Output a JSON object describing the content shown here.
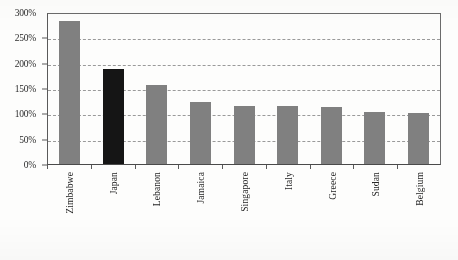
{
  "chart_data": {
    "type": "bar",
    "title": "",
    "xlabel": "",
    "ylabel": "",
    "categories": [
      "Zimbabwe",
      "Japan",
      "Lebanon",
      "Jamaica",
      "Singapore",
      "Italy",
      "Greece",
      "Sudan",
      "Belgium"
    ],
    "values": [
      282,
      188,
      156,
      123,
      114,
      115,
      112,
      103,
      100
    ],
    "value_suffix": "%",
    "ylim": [
      0,
      300
    ],
    "yticks": [
      0,
      50,
      100,
      150,
      200,
      250,
      300
    ],
    "ytick_labels": [
      "0%",
      "50%",
      "100%",
      "150%",
      "200%",
      "250%",
      "300%"
    ],
    "grid": true,
    "grid_style": "dashed-horizontal",
    "legend": "none",
    "bar_colors": [
      "#808080",
      "#151515",
      "#808080",
      "#808080",
      "#808080",
      "#808080",
      "#808080",
      "#808080",
      "#808080"
    ],
    "highlight_category": "Japan",
    "colors": {
      "bar_default": "#808080",
      "bar_highlight": "#151515",
      "axis": "#4a4a4a",
      "gridline": "#9a9a9a",
      "text": "#242424",
      "background": "#fdfdfc"
    }
  },
  "caption": {
    "text": ""
  }
}
